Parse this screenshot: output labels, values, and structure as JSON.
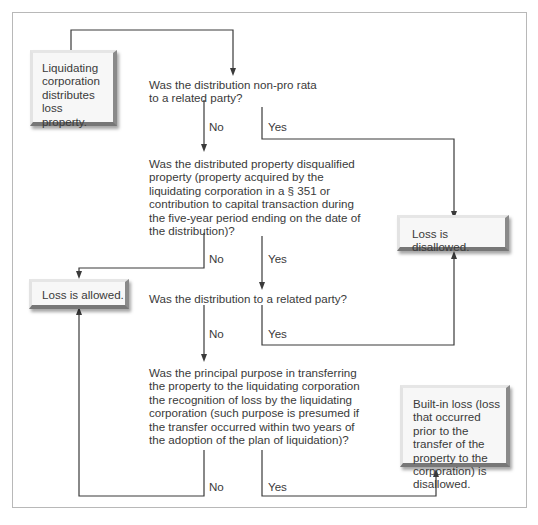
{
  "diagram": {
    "type": "flowchart",
    "colors": {
      "line": "#3a3a3a",
      "text": "#3a3a3a",
      "frame": "#b8b8b8",
      "box_fill": "#f7f7f7"
    },
    "start": {
      "text": "Liquidating corporation distributes loss property."
    },
    "questions": [
      {
        "id": "q1",
        "text": "Was the distribution non-pro rata to a related party?",
        "no_label": "No",
        "yes_label": "Yes"
      },
      {
        "id": "q2",
        "text": "Was the distributed property disqualified property (property acquired by the liquidating corporation in a § 351 or contribution to capital transaction during the five-year period ending on the date of the distribution)?",
        "no_label": "No",
        "yes_label": "Yes"
      },
      {
        "id": "q3",
        "text": "Was the distribution to a related party?",
        "no_label": "No",
        "yes_label": "Yes"
      },
      {
        "id": "q4",
        "text": "Was the principal purpose in transferring the property to the liquidating corporation the recognition of loss by the liquidating corporation (such purpose is presumed if the transfer occurred within two years of the adoption of the plan of liquidation)?",
        "no_label": "No",
        "yes_label": "Yes"
      }
    ],
    "outcomes": {
      "disallowed": "Loss is disallowed.",
      "allowed": "Loss is allowed.",
      "builtin": "Built-in loss (loss that occurred prior to the transfer of the property to the corporation) is disallowed."
    },
    "edges": [
      {
        "from": "start",
        "to": "q1"
      },
      {
        "from": "q1",
        "label": "No",
        "to": "q2"
      },
      {
        "from": "q1",
        "label": "Yes",
        "to": "disallowed"
      },
      {
        "from": "q2",
        "label": "No",
        "to": "allowed"
      },
      {
        "from": "q2",
        "label": "Yes",
        "to": "q3"
      },
      {
        "from": "q3",
        "label": "No",
        "to": "q4"
      },
      {
        "from": "q3",
        "label": "Yes",
        "to": "disallowed"
      },
      {
        "from": "q4",
        "label": "No",
        "to": "allowed"
      },
      {
        "from": "q4",
        "label": "Yes",
        "to": "builtin"
      }
    ]
  }
}
